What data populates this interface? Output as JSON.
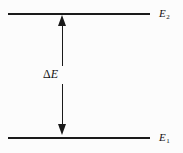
{
  "figure": {
    "type": "energy-level-diagram",
    "background_color": "#fcfcfc",
    "stroke_color": "#1a1a1a",
    "width": 183,
    "height": 153
  },
  "levels": {
    "upper": {
      "label_base": "E",
      "label_subscript": "2",
      "label_full": "E2"
    },
    "lower": {
      "label_base": "E",
      "label_subscript": "1",
      "label_full": "E1"
    }
  },
  "transition": {
    "delta_symbol": "Δ",
    "delta_variable": "E",
    "label_full": "ΔE",
    "arrow_style": "double-headed-vertical",
    "head_up_name": "arrow-head-up",
    "head_down_name": "arrow-head-down"
  },
  "chart_data": {
    "type": "diagram",
    "title": "",
    "xlabel": "",
    "ylabel": "",
    "levels": [
      {
        "name": "E1",
        "energy_rank": 1,
        "y_px": 138,
        "x_start_px": 8,
        "x_end_px": 150
      },
      {
        "name": "E2",
        "energy_rank": 2,
        "y_px": 14,
        "x_start_px": 8,
        "x_end_px": 150
      }
    ],
    "annotations": [
      {
        "text": "ΔE",
        "kind": "energy-gap",
        "between": [
          "E1",
          "E2"
        ],
        "x_px": 62,
        "y_top_px": 14,
        "y_bottom_px": 138
      }
    ],
    "grid": false,
    "legend": false
  }
}
